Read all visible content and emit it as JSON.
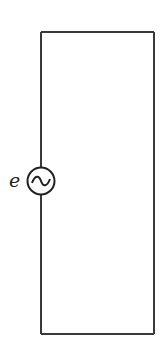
{
  "diagram": {
    "type": "circuit",
    "source": {
      "label": "e",
      "symbol": "ac-voltage-source",
      "glyph": "~"
    },
    "colors": {
      "wire": "#3a3a3a",
      "background": "#ffffff",
      "text": "#222222"
    }
  }
}
